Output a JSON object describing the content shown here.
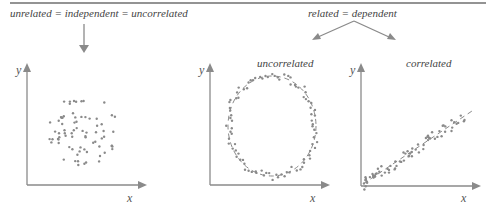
{
  "header": {
    "left_caption": "unrelated = independent = uncorrelated",
    "right_caption": "related = dependent"
  },
  "panels": [
    {
      "id": "independent",
      "title": "",
      "x_label": "x",
      "y_label": "y"
    },
    {
      "id": "uncorrelated",
      "title": "uncorrelated",
      "x_label": "x",
      "y_label": "y"
    },
    {
      "id": "correlated",
      "title": "correlated",
      "x_label": "x",
      "y_label": "y"
    }
  ],
  "colors": {
    "axis": "#8a8a8a",
    "points": "#8a8a8a",
    "rule": "#6f6f6f",
    "text": "#444444"
  },
  "icons": {
    "down-arrow": "arrow pointing from left caption to independent panel",
    "branch-arrows": "two arrows from related caption to uncorrelated and correlated panels"
  }
}
